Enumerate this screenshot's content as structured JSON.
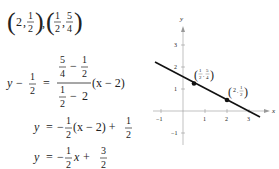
{
  "points_header": {
    "p1": {
      "x": "2",
      "y_num": "1",
      "y_den": "2"
    },
    "p2": {
      "x_num": "1",
      "x_den": "2",
      "y_num": "5",
      "y_den": "4"
    }
  },
  "steps": {
    "step1": {
      "lhs_var": "y",
      "lhs_minus": "−",
      "lhs_num": "1",
      "lhs_den": "2",
      "eq": "=",
      "slope_top_a_num": "5",
      "slope_top_a_den": "4",
      "slope_top_b_num": "1",
      "slope_top_b_den": "2",
      "slope_bot_a_num": "1",
      "slope_bot_a_den": "2",
      "slope_bot_b": "2",
      "factor": "(x − 2)"
    },
    "step2": {
      "lhs": "y",
      "eq": "=",
      "neg": "−",
      "coef_num": "1",
      "coef_den": "2",
      "factor": "(x − 2) +",
      "const_num": "1",
      "const_den": "2"
    },
    "step3": {
      "lhs": "y",
      "eq": "=",
      "neg": "−",
      "coef_num": "1",
      "coef_den": "2",
      "var": "x +",
      "const_num": "3",
      "const_den": "2"
    }
  },
  "graph": {
    "x_axis_label": "x",
    "y_axis_label": "y",
    "x_ticks": [
      "−1",
      "1",
      "2",
      "3"
    ],
    "y_ticks": [
      "3",
      "2",
      "1",
      "−1"
    ],
    "point_a_label": {
      "x_num": "1",
      "x_den": "2",
      "y_num": "5",
      "y_den": "4"
    },
    "point_b_label": {
      "x": "2",
      "y_num": "1",
      "y_den": "2"
    },
    "line_color": "#111111",
    "axis_color": "#888888"
  }
}
